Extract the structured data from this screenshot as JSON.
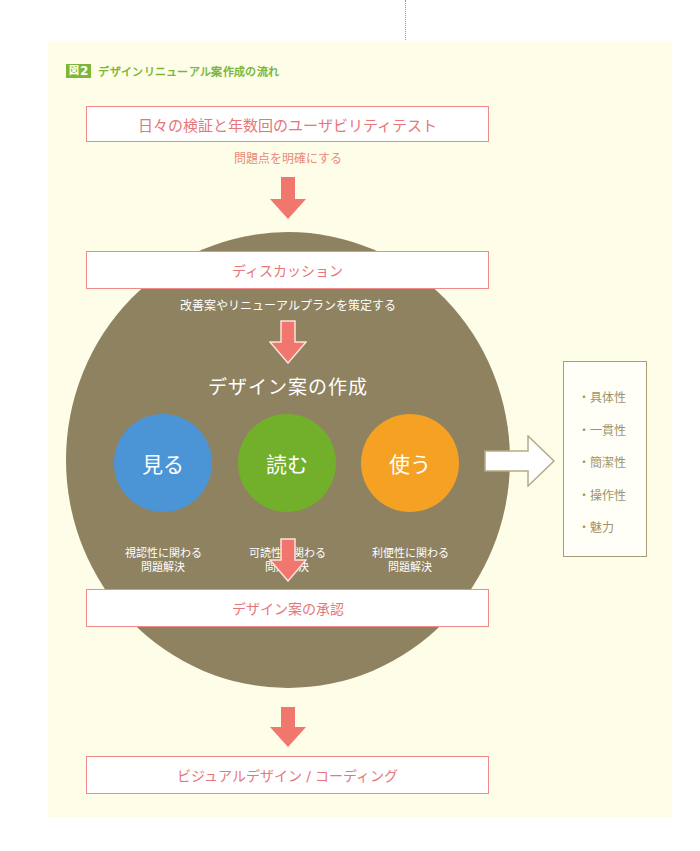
{
  "figure": {
    "badge_prefix": "図",
    "badge_number": "2",
    "title": "デザインリニューアル案作成の流れ"
  },
  "steps": {
    "step1": {
      "label": "日々の検証と年数回のユーザビリティテスト",
      "note": "問題点を明確にする"
    },
    "step2": {
      "label": "ディスカッション",
      "note": "改善案やリニューアルプランを策定する"
    },
    "creation": {
      "title": "デザイン案の作成",
      "circles": [
        {
          "label": "見る",
          "caption_line1": "視認性に関わる",
          "caption_line2": "問題解決",
          "color": "#4b95d6"
        },
        {
          "label": "読む",
          "caption_line1": "可読性に関わる",
          "caption_line2": "問題解決",
          "color": "#72b02c"
        },
        {
          "label": "使う",
          "caption_line1": "利便性に関わる",
          "caption_line2": "問題解決",
          "color": "#f5a224"
        }
      ]
    },
    "step3": {
      "label": "デザイン案の承認"
    },
    "step4": {
      "label": "ビジュアルデザイン / コーディング"
    }
  },
  "criteria": {
    "bullet": "・",
    "items": [
      "具体性",
      "一貫性",
      "簡潔性",
      "操作性",
      "魅力"
    ]
  },
  "colors": {
    "accent_green": "#7cb63a",
    "arrow_red": "#f0766e",
    "circle_brown": "#8e8260",
    "panel_bg": "#fdfde8"
  }
}
